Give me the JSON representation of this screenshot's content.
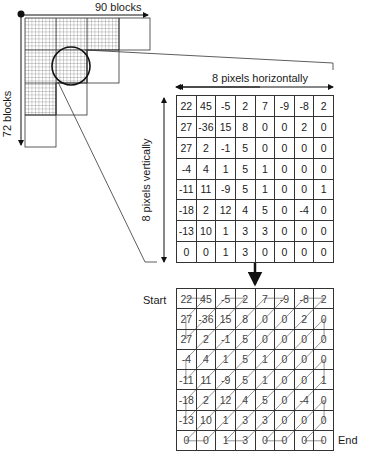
{
  "overview": {
    "horizontal_label": "90 blocks",
    "vertical_label": "72 blocks"
  },
  "block_detail": {
    "horizontal_label": "8 pixels horizontally",
    "vertical_label": "8 pixels vertically",
    "values": [
      [
        22,
        45,
        -5,
        2,
        7,
        -9,
        -8,
        2
      ],
      [
        27,
        -36,
        15,
        8,
        0,
        0,
        2,
        0
      ],
      [
        27,
        2,
        -1,
        5,
        0,
        0,
        0,
        0
      ],
      [
        -4,
        4,
        1,
        5,
        1,
        0,
        0,
        0
      ],
      [
        -11,
        11,
        -9,
        5,
        1,
        0,
        0,
        1
      ],
      [
        -18,
        2,
        12,
        4,
        5,
        0,
        -4,
        0
      ],
      [
        -13,
        10,
        1,
        3,
        3,
        0,
        0,
        0
      ],
      [
        0,
        0,
        1,
        3,
        0,
        0,
        0,
        0
      ]
    ]
  },
  "zigzag": {
    "start_label": "Start",
    "end_label": "End",
    "values": [
      [
        22,
        45,
        -5,
        2,
        7,
        -9,
        -8,
        2
      ],
      [
        27,
        -36,
        15,
        8,
        0,
        0,
        2,
        0
      ],
      [
        27,
        2,
        -1,
        5,
        0,
        0,
        0,
        0
      ],
      [
        -4,
        4,
        1,
        5,
        1,
        0,
        0,
        0
      ],
      [
        -11,
        11,
        -9,
        5,
        1,
        0,
        0,
        1
      ],
      [
        -18,
        2,
        12,
        4,
        5,
        0,
        -4,
        0
      ],
      [
        -13,
        10,
        1,
        3,
        3,
        0,
        0,
        0
      ],
      [
        0,
        0,
        1,
        3,
        0,
        0,
        0,
        0
      ]
    ]
  }
}
